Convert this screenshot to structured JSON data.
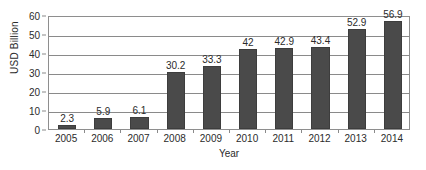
{
  "chart_data": {
    "type": "bar",
    "title": "",
    "xlabel": "Year",
    "ylabel": "USD Billion",
    "categories": [
      "2005",
      "2006",
      "2007",
      "2008",
      "2009",
      "2010",
      "2011",
      "2012",
      "2013",
      "2014"
    ],
    "values": [
      2.3,
      5.9,
      6.1,
      30.2,
      33.3,
      42,
      42.9,
      43.4,
      52.9,
      56.9
    ],
    "data_labels": [
      "2.3",
      "5.9",
      "6.1",
      "30.2",
      "33.3",
      "42",
      "42.9",
      "43.4",
      "52.9",
      "56.9"
    ],
    "ylim": [
      0,
      60
    ],
    "ytick_values": [
      0,
      10,
      20,
      30,
      40,
      50,
      60
    ],
    "ytick_labels": [
      "0",
      "10",
      "20",
      "30",
      "40",
      "50",
      "60"
    ],
    "grid": true,
    "legend": false,
    "legend_position": "none",
    "series": [
      {
        "name": "USD Billion",
        "color": "#4a4a4a",
        "values": [
          2.3,
          5.9,
          6.1,
          30.2,
          33.3,
          42,
          42.9,
          43.4,
          52.9,
          56.9
        ]
      }
    ],
    "colors": {
      "bar": "#4a4a4a",
      "bar_edge": "#3d3d3d",
      "grid": "#8a8a8a",
      "frame": "#8e8e8e",
      "text": "#2b2b2b",
      "background": "#ffffff"
    }
  }
}
